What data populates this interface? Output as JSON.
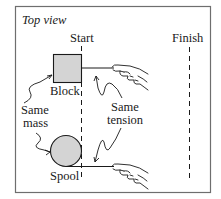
{
  "diagram": {
    "title": "Top view",
    "start_label": "Start",
    "finish_label": "Finish",
    "block_label": "Block",
    "spool_label": "Spool",
    "same_mass_line1": "Same",
    "same_mass_line2": "mass",
    "same_tension_line1": "Same",
    "same_tension_line2": "tension",
    "colors": {
      "frame": "#6e6e6e",
      "object_fill": "#d4d4d4",
      "stroke": "#1a1a1a"
    }
  }
}
